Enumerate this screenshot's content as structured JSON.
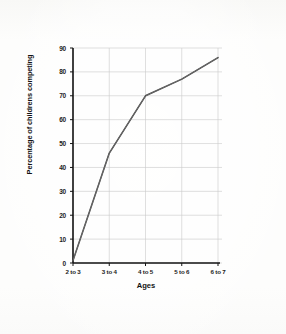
{
  "chart_data": {
    "type": "line",
    "title": "",
    "xlabel": "Ages",
    "ylabel": "Percentage of childrens competing",
    "categories": [
      "2 to 3",
      "3 to 4",
      "4 to 5",
      "5 to 6",
      "6 to 7"
    ],
    "values": [
      1,
      46,
      70,
      77,
      86
    ],
    "series": [
      {
        "name": "Percentage of childrens competing",
        "values": [
          1,
          46,
          70,
          77,
          86
        ]
      }
    ],
    "ylim": [
      0,
      90
    ],
    "yticks": [
      0,
      10,
      20,
      30,
      40,
      50,
      60,
      70,
      80,
      90
    ],
    "ytick_labels": [
      "0",
      "10",
      "20",
      "30",
      "40",
      "50",
      "60",
      "70",
      "80",
      "90"
    ],
    "xtick_labels": [
      "2 to 3",
      "3 to 4",
      "4 to 5",
      "5 to 6",
      "6 to 7"
    ],
    "grid": true,
    "legend": false,
    "legend_position": "none",
    "line_color": "#3a3a3a",
    "axis_color": "#141414",
    "grid_color": "#c9c9c9",
    "background_color": "#fdfdfc",
    "paper_grid_color": "#cfd6de"
  }
}
